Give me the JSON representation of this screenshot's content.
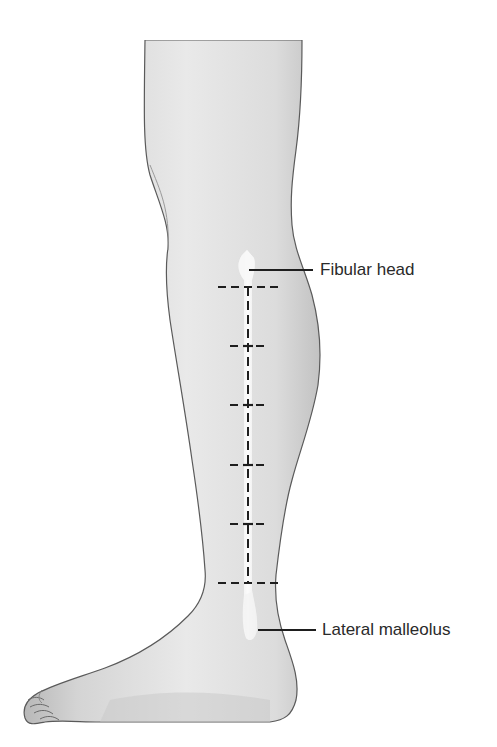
{
  "figure": {
    "labels": [
      {
        "id": "fibular_head",
        "text": "Fibular head"
      },
      {
        "id": "lateral_malleolus",
        "text": "Lateral malleolus"
      }
    ],
    "measurement_marks": {
      "count_horizontal": 6,
      "style": "dashed"
    },
    "colors": {
      "background": "#ffffff",
      "skin_light": "#ececec",
      "skin_shade": "#bdbdbd",
      "outline": "#5a5a5a",
      "bone_highlight": "#f7f7f7",
      "line": "#1e1e1e",
      "text": "#2a2a2a"
    }
  }
}
